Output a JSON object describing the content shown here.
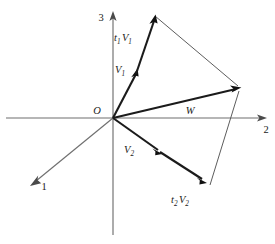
{
  "figure": {
    "kind": "vector-diagram",
    "caption": "",
    "background_color": "#ffffff",
    "axis_color": "#6f6f6f",
    "vector_color": "#1b1b1b",
    "edge_color": "#5d5d5d"
  },
  "axes": [
    {
      "name": "axis-1",
      "label": "1",
      "from": [
        113,
        118
      ],
      "to": [
        30,
        186
      ],
      "arrow": true
    },
    {
      "name": "axis-2",
      "label": "2",
      "from": [
        113,
        118
      ],
      "to": [
        265,
        118
      ],
      "arrow": true
    },
    {
      "name": "axis-3",
      "label": "3",
      "from": [
        113,
        118
      ],
      "to": [
        113,
        13
      ],
      "arrow": true
    }
  ],
  "origin": {
    "label": "O",
    "point": [
      113,
      118
    ]
  },
  "vectors": [
    {
      "name": "v1",
      "label": "V",
      "sub": "1",
      "from": [
        113,
        118
      ],
      "to": [
        136,
        72
      ],
      "style": "thick",
      "label_pos": [
        117,
        69
      ]
    },
    {
      "name": "t1v1",
      "label": "t",
      "sub": "1",
      "label2": "V",
      "sub2": "1",
      "from": [
        136,
        72
      ],
      "to": [
        155,
        16
      ],
      "style": "thick",
      "label_pos": [
        120,
        37
      ]
    },
    {
      "name": "v2",
      "label": "V",
      "sub": "2",
      "from": [
        113,
        118
      ],
      "to": [
        160,
        152
      ],
      "style": "thick",
      "label_pos": [
        128,
        150
      ]
    },
    {
      "name": "t2v2",
      "label": "t",
      "sub": "2",
      "label2": "V",
      "sub2": "2",
      "from": [
        160,
        152
      ],
      "to": [
        205,
        182
      ],
      "style": "thick",
      "label_pos": [
        178,
        200
      ]
    },
    {
      "name": "w",
      "label": "W",
      "sub": "",
      "from": [
        113,
        118
      ],
      "to": [
        240,
        88
      ],
      "style": "thick",
      "label_pos": [
        190,
        113
      ]
    }
  ],
  "edges": [
    {
      "name": "edge-t1v1-to-w-tip",
      "from": [
        155,
        16
      ],
      "to": [
        240,
        88
      ]
    },
    {
      "name": "edge-t2v2-to-w-tip",
      "from": [
        210,
        185
      ],
      "to": [
        240,
        88
      ]
    }
  ],
  "labels": {
    "axis_1": "1",
    "axis_2": "2",
    "axis_3": "3",
    "origin": "O",
    "v1": "V",
    "v1_sub": "1",
    "t1v1_t": "t",
    "t1v1_t_sub": "1",
    "t1v1_v": "V",
    "t1v1_v_sub": "1",
    "v2": "V",
    "v2_sub": "2",
    "t2v2_t": "t",
    "t2v2_t_sub": "2",
    "t2v2_v": "V",
    "t2v2_v_sub": "2",
    "w": "W"
  }
}
